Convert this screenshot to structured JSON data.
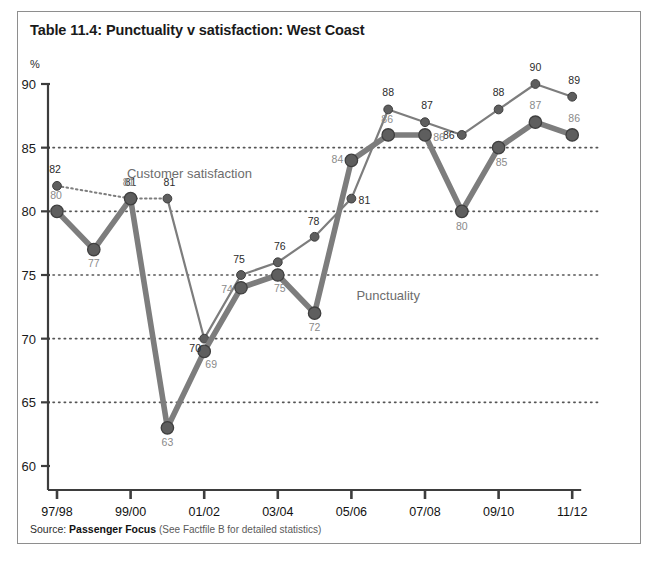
{
  "figure": {
    "title": "Table 11.4: Punctuality v satisfaction: West Coast",
    "axis_unit": "%",
    "source_label": "Source:",
    "source_org": "Passenger Focus",
    "source_extra": "(See Factfile B for detailed statistics)"
  },
  "colors": {
    "frame": "#8e8e8e",
    "axis": "#3d3d3d",
    "gridline": "#555555",
    "punctuality_line": "#7d7d7d",
    "punctuality_marker": "#5e5e5e",
    "satisfaction_line": "#7d7d7d",
    "satisfaction_marker": "#5e5e5e",
    "value_label_dark": "#2b2b2b",
    "value_label_light": "#8a8a8a",
    "series_label": "#6d6d6d",
    "background": "#ffffff"
  },
  "chart_data": {
    "type": "line",
    "title": "Table 11.4: Punctuality v satisfaction: West Coast",
    "xlabel": "",
    "ylabel": "%",
    "ylim": [
      58,
      90
    ],
    "yticks": [
      60,
      65,
      70,
      75,
      80,
      85,
      90
    ],
    "grid": "horizontal-dotted",
    "legend": "inline-annotation",
    "x": [
      "97/98",
      "98/99",
      "99/00",
      "00/01",
      "01/02",
      "02/03",
      "03/04",
      "04/05",
      "05/06",
      "06/07",
      "07/08",
      "08/09",
      "09/10",
      "10/11",
      "11/12"
    ],
    "xticks": [
      "97/98",
      "99/00",
      "01/02",
      "03/04",
      "05/06",
      "07/08",
      "09/10",
      "11/12"
    ],
    "xtick_indices": [
      0,
      2,
      4,
      6,
      8,
      10,
      12,
      14
    ],
    "series": [
      {
        "name": "Punctuality",
        "style": "thick-solid",
        "label_position": "below",
        "label_color": "#8a8a8a",
        "values": [
          80,
          77,
          81,
          63,
          69,
          74,
          75,
          72,
          84,
          86,
          86,
          80,
          85,
          87,
          86
        ]
      },
      {
        "name": "Customer satisfaction",
        "style": "thin-solid-with-leading-dotted",
        "label_position": "above",
        "label_color": "#2b2b2b",
        "values": [
          82,
          null,
          81,
          81,
          70,
          75,
          76,
          78,
          81,
          88,
          87,
          86,
          88,
          90,
          89
        ]
      }
    ],
    "annotations": [
      {
        "text": "Customer satisfaction",
        "x_index": 3.6,
        "y": 82.6
      },
      {
        "text": "Punctuality",
        "x_index": 9.0,
        "y": 73.0
      }
    ]
  }
}
